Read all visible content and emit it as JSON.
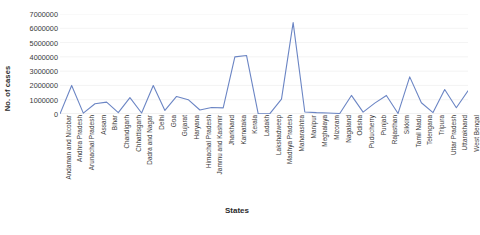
{
  "chart_data": {
    "type": "line",
    "title": "",
    "xlabel": "States",
    "ylabel": "No. of cases",
    "ylim": [
      0,
      7000000
    ],
    "ytick_labels": [
      "7000000",
      "6000000",
      "5000000",
      "4000000",
      "3000000",
      "2000000",
      "1000000",
      "0"
    ],
    "ytick_values": [
      7000000,
      6000000,
      5000000,
      4000000,
      3000000,
      2000000,
      1000000,
      0
    ],
    "grid": true,
    "legend": "none",
    "line_color": "#6b85c4",
    "categories": [
      "Andaman and Nicobar",
      "Andhra Pradesh",
      "Arunachal Pradesh",
      "Assam",
      "Bihar",
      "Chandigarh",
      "Chhattisgarh",
      "Dadra and Nagar",
      "Delhi",
      "Goa",
      "Gujarat",
      "Haryana",
      "Himachal Pradesh",
      "Jammu and Kashmir",
      "Jharkhand",
      "Karnataka",
      "Kerala",
      "Ladakh",
      "Lakshadweep",
      "Madhya Pradesh",
      "Maharashtra",
      "Manipur",
      "Meghalaya",
      "Mizoram",
      "Nagaland",
      "Odisha",
      "Puducherry",
      "Punjab",
      "Rajasthan",
      "Sikkim",
      "Tamil Nadu",
      "Telengana",
      "Tripura",
      "Uttar Pradesh",
      "Uttarakhand",
      "West Bengal"
    ],
    "values": [
      10000,
      2000000,
      60000,
      720000,
      830000,
      90000,
      1150000,
      70000,
      1990000,
      250000,
      1230000,
      1000000,
      280000,
      450000,
      430000,
      4000000,
      4100000,
      30000,
      20000,
      1040000,
      6400000,
      140000,
      95000,
      70000,
      35000,
      1300000,
      130000,
      760000,
      1300000,
      40000,
      2600000,
      790000,
      100000,
      1710000,
      440000,
      1620000
    ]
  }
}
